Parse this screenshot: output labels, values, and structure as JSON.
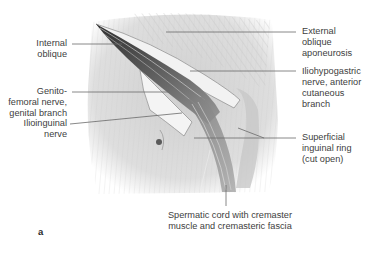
{
  "figure": {
    "panel_letter": "a",
    "labels": {
      "internal_oblique": [
        "Internal",
        "oblique"
      ],
      "genitofemoral": [
        "Genito-",
        "femoral nerve,",
        "genital branch"
      ],
      "ilioinguinal": [
        "Ilioinguinal",
        "nerve"
      ],
      "external_oblique": [
        "External",
        "oblique",
        "aponeurosis"
      ],
      "iliohypogastric": [
        "Iliohypogastric",
        "nerve, anterior",
        "cutaneous",
        "branch"
      ],
      "superficial_ring": [
        "Superficial",
        "inguinal ring",
        "(cut open)"
      ],
      "spermatic_cord": [
        "Spermatic cord with cremaster",
        "muscle and cremasteric fascia"
      ]
    },
    "colors": {
      "text": "#404040",
      "leader_line": "#6a6a6a",
      "tissue_light": "#e6e6e6",
      "tissue_mid": "#b8b8b8",
      "tissue_dark": "#4a4a4a",
      "background": "#ffffff"
    }
  }
}
